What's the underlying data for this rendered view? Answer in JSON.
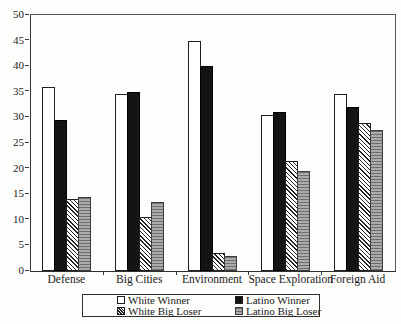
{
  "chart_data": {
    "type": "bar",
    "title": "",
    "xlabel": "",
    "ylabel": "",
    "categories": [
      "Defense",
      "Big Cities",
      "Environment",
      "Space Exploration",
      "Foreign Aid"
    ],
    "series": [
      {
        "name": "White Winner",
        "pattern": "white",
        "values": [
          36,
          34.5,
          45,
          30.5,
          34.5
        ]
      },
      {
        "name": "Latino Winner",
        "pattern": "black",
        "values": [
          29.5,
          35,
          40,
          31,
          32
        ]
      },
      {
        "name": "White Big Loser",
        "pattern": "hatch",
        "values": [
          14,
          10.5,
          3.5,
          21.5,
          29
        ]
      },
      {
        "name": "Latino Big Loser",
        "pattern": "gray",
        "values": [
          14.5,
          13.5,
          3,
          19.5,
          27.5
        ]
      }
    ],
    "ylim": [
      0,
      50
    ],
    "yticks": [
      0,
      5,
      10,
      15,
      20,
      25,
      30,
      35,
      40,
      45,
      50
    ],
    "grid": false,
    "legend_position": "bottom-center-boxed"
  },
  "legend": {
    "items": [
      {
        "label": "White Winner",
        "pattern": "white"
      },
      {
        "label": "Latino Winner",
        "pattern": "black"
      },
      {
        "label": "White Big Loser",
        "pattern": "hatch"
      },
      {
        "label": "Latino Big Loser",
        "pattern": "gray"
      }
    ]
  },
  "colors": {
    "background": "#fdfdfc",
    "bar_black": "#141414",
    "bar_white": "#ffffff",
    "bar_gray": "#ababab",
    "outline": "#1f1f1f",
    "frame": "#5a5a5a",
    "text": "#1a1a1a"
  }
}
